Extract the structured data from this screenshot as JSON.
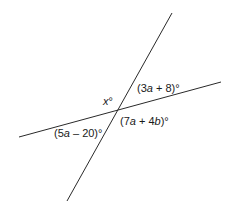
{
  "diagram": {
    "type": "intersecting-lines",
    "lines": [
      {
        "id": "line-steep",
        "x1": 172,
        "y1": 13,
        "x2": 67,
        "y2": 201
      },
      {
        "id": "line-shallow",
        "x1": 19,
        "y1": 137,
        "x2": 221,
        "y2": 82
      }
    ],
    "stroke_color": "#2a2a2a",
    "labels": {
      "x_angle": {
        "var": "x",
        "suffix": "°",
        "left": 103,
        "top": 96
      },
      "top_right": {
        "pre": "(3",
        "var1": "a",
        "mid": " + 8)°",
        "left": 137,
        "top": 83
      },
      "bottom_right": {
        "pre": "(7",
        "var1": "a",
        "mid": " + 4",
        "var2": "b",
        "post": ")°",
        "left": 120,
        "top": 116
      },
      "bottom_left": {
        "pre": "(5",
        "var1": "a",
        "mid": " – 20)°",
        "left": 54,
        "top": 128
      }
    }
  }
}
